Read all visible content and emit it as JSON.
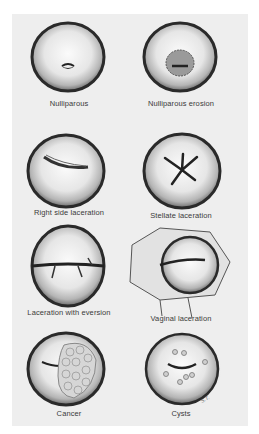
{
  "figure": {
    "panels": [
      {
        "id": "nulliparous",
        "label": "Nulliparous"
      },
      {
        "id": "nulliparous-erosion",
        "label": "Nulliparous erosion"
      },
      {
        "id": "right-side-laceration",
        "label": "Right side laceration"
      },
      {
        "id": "stellate-laceration",
        "label": "Stellate laceration"
      },
      {
        "id": "laceration-with-eversion",
        "label": "Laceration with eversion"
      },
      {
        "id": "vaginal-laceration",
        "label": "Vaginal laceration"
      },
      {
        "id": "cancer",
        "label": "Cancer"
      },
      {
        "id": "cysts",
        "label": "Cysts"
      }
    ],
    "signature": "S.T."
  }
}
